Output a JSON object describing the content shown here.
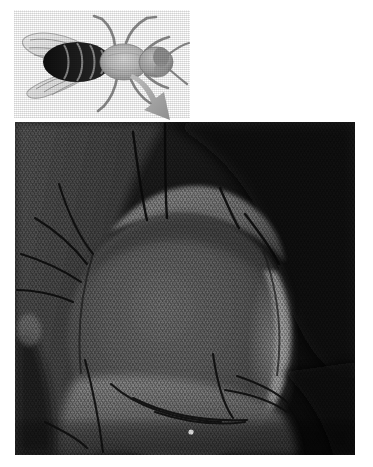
{
  "figure": {
    "kind": "scientific-figure",
    "background_color": "#ffffff",
    "width_px": 373,
    "height_px": 467,
    "caption": ""
  },
  "fly": {
    "label": "drosophila-fly-dorsal-view",
    "orientation": "dorsal view, head to the right",
    "body_color": "#b9b9b9",
    "abdomen_band_color": "#161616",
    "wing_color": "#e8e8e8",
    "thorax_color": "#c4c4c4",
    "eye_color": "#8e8e8e",
    "parts": [
      {
        "name": "wing-left",
        "shade": "#ededed"
      },
      {
        "name": "wing-right",
        "shade": "#e4e4e4"
      },
      {
        "name": "abdomen",
        "shade": "#1a1a1a"
      },
      {
        "name": "thorax",
        "shade": "#c6c6c6"
      },
      {
        "name": "head",
        "shade": "#a8a8a8"
      },
      {
        "name": "compound-eye",
        "shade": "#909090"
      },
      {
        "name": "legs",
        "shade": "#9a9a9a"
      },
      {
        "name": "antenna",
        "shade": "#9a9a9a"
      }
    ]
  },
  "arrow": {
    "label": "pointer-arrow",
    "direction": "down-right",
    "color": "#a6a6a6",
    "from": "fly head",
    "to": "micrograph panel"
  },
  "micrograph": {
    "label": "sem-head-micrograph",
    "modality": "scanning electron micrograph",
    "subject": "Drosophila head and compound eye",
    "frame": {
      "left_px": 15,
      "top_px": 122,
      "width_px": 340,
      "height_px": 333
    },
    "palette": {
      "background_dark": "#0d0d0d",
      "shadow": "#1c1c1c",
      "eye_mid": "#4c4c4c",
      "eye_light": "#6e6e6e",
      "highlight_rim": "#8f8f8f",
      "face_light": "#7a7a7a",
      "bristle": "#101010"
    },
    "features": [
      {
        "name": "compound-eye",
        "description": "large ovoid eye with hexagonal ommatidial texture"
      },
      {
        "name": "ommatidia-texture",
        "description": "fine granular lens array across eye surface"
      },
      {
        "name": "head-capsule-ridge",
        "description": "lighter arching ridge above the eye"
      },
      {
        "name": "orbital-bristles",
        "description": "dark curved bristles along upper-left margin"
      },
      {
        "name": "eye-rim-highlight",
        "description": "bright crescent along right edge of eye"
      },
      {
        "name": "face-region",
        "description": "lighter textured cuticle below the eye"
      },
      {
        "name": "vibrissae-bristles",
        "description": "branching dark bristles across lower face"
      },
      {
        "name": "dark-background",
        "description": "near-black specimen-stage background"
      }
    ]
  }
}
